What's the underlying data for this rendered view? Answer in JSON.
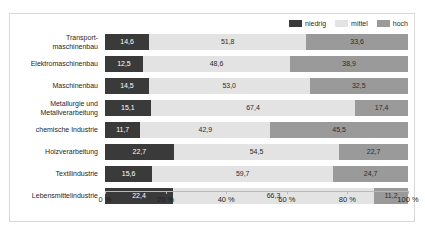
{
  "chart_data": {
    "type": "bar",
    "orientation": "horizontal",
    "stacked": true,
    "stacked_percent": true,
    "title": "",
    "xlabel": "",
    "ylabel": "",
    "xlim": [
      0,
      100
    ],
    "grid": false,
    "legend_position": "top-right",
    "categories": [
      "Transport-\nmaschinenbau",
      "Elektromaschinenbau",
      "Maschinenbau",
      "Metallurgie und\nMetallverarbeitung",
      "chemische Industrie",
      "Holzverarbeitung",
      "Textilindustrie",
      "Lebensmittelindustrie"
    ],
    "series": [
      {
        "name": "niedrig",
        "color": "#3a3a3a",
        "values": [
          14.6,
          12.5,
          14.5,
          15.1,
          11.7,
          22.7,
          15.6,
          22.4
        ],
        "labels": [
          "14,6",
          "12,5",
          "14,5",
          "15,1",
          "11,7",
          "22,7",
          "15,6",
          "22,4"
        ]
      },
      {
        "name": "mittel",
        "color": "#e3e3e3",
        "values": [
          51.8,
          48.6,
          53.0,
          67.4,
          42.9,
          54.5,
          59.7,
          66.3
        ],
        "labels": [
          "51,8",
          "48,6",
          "53,0",
          "67,4",
          "42,9",
          "54,5",
          "59,7",
          "66,3"
        ]
      },
      {
        "name": "hoch",
        "color": "#9a9a9a",
        "values": [
          33.6,
          38.9,
          32.5,
          17.4,
          45.5,
          22.7,
          24.7,
          11.2
        ],
        "labels": [
          "33,6",
          "38,9",
          "32,5",
          "17,4",
          "45,5",
          "22,7",
          "24,7",
          "11,2"
        ]
      }
    ],
    "xticks": [
      0,
      20,
      40,
      60,
      80,
      100
    ],
    "xtick_labels": [
      "0 %",
      "20 %",
      "40 %",
      "60 %",
      "80 %",
      "100 %"
    ]
  },
  "legend": {
    "items": [
      {
        "label": "niedrig",
        "color": "#3a3a3a"
      },
      {
        "label": "mittel",
        "color": "#e3e3e3"
      },
      {
        "label": "hoch",
        "color": "#9a9a9a"
      }
    ]
  }
}
